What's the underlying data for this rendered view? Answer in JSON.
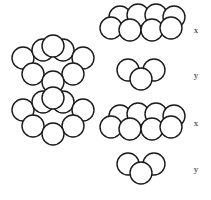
{
  "figure": {
    "stroke_color": "#1a1a1a",
    "fill_color": "#ffffff",
    "background_color": "#ffffff",
    "sphere_radius": 11,
    "label_font_size": 9
  },
  "stack": {
    "name": "assembled-stack",
    "description": "Four close-packed layers stacked in x-y-x-y sequence",
    "layers": [
      {
        "label": "x",
        "sphere_count": 5,
        "spheres": [
          {
            "cx": 23,
            "cy": 58
          },
          {
            "cx": 43,
            "cy": 50
          },
          {
            "cx": 63,
            "cy": 50
          },
          {
            "cx": 83,
            "cy": 58
          },
          {
            "cx": 53,
            "cy": 46
          }
        ]
      },
      {
        "label": "y",
        "sphere_count": 3,
        "spheres": [
          {
            "cx": 33,
            "cy": 74
          },
          {
            "cx": 73,
            "cy": 74
          },
          {
            "cx": 53,
            "cy": 82
          }
        ]
      },
      {
        "label": "x",
        "sphere_count": 5,
        "spheres": [
          {
            "cx": 23,
            "cy": 110
          },
          {
            "cx": 43,
            "cy": 102
          },
          {
            "cx": 63,
            "cy": 102
          },
          {
            "cx": 83,
            "cy": 110
          },
          {
            "cx": 53,
            "cy": 98
          }
        ]
      },
      {
        "label": "y",
        "sphere_count": 3,
        "spheres": [
          {
            "cx": 33,
            "cy": 126
          },
          {
            "cx": 73,
            "cy": 126
          },
          {
            "cx": 53,
            "cy": 134
          }
        ]
      }
    ]
  },
  "exploded_layers": [
    {
      "id": "layer-x-top",
      "label": "x",
      "label_x": 196,
      "label_y": 31,
      "sphere_count": 7,
      "back_row": [
        {
          "cx": 120,
          "cy": 17
        },
        {
          "cx": 138,
          "cy": 15
        },
        {
          "cx": 156,
          "cy": 15
        },
        {
          "cx": 174,
          "cy": 17
        }
      ],
      "front_row": [
        {
          "cx": 111,
          "cy": 28
        },
        {
          "cx": 130,
          "cy": 30
        },
        {
          "cx": 152,
          "cy": 30
        },
        {
          "cx": 171,
          "cy": 28
        }
      ]
    },
    {
      "id": "layer-y-upper",
      "label": "y",
      "label_x": 196,
      "label_y": 76,
      "sphere_count": 3,
      "back_row": [
        {
          "cx": 128,
          "cy": 70
        },
        {
          "cx": 154,
          "cy": 70
        }
      ],
      "front_row": [
        {
          "cx": 141,
          "cy": 79
        }
      ]
    },
    {
      "id": "layer-x-lower",
      "label": "x",
      "label_x": 196,
      "label_y": 124,
      "sphere_count": 7,
      "back_row": [
        {
          "cx": 120,
          "cy": 116
        },
        {
          "cx": 138,
          "cy": 114
        },
        {
          "cx": 156,
          "cy": 114
        },
        {
          "cx": 174,
          "cy": 116
        }
      ],
      "front_row": [
        {
          "cx": 111,
          "cy": 127
        },
        {
          "cx": 130,
          "cy": 129
        },
        {
          "cx": 152,
          "cy": 129
        },
        {
          "cx": 171,
          "cy": 127
        }
      ]
    },
    {
      "id": "layer-y-bottom",
      "label": "y",
      "label_x": 196,
      "label_y": 170,
      "sphere_count": 3,
      "back_row": [
        {
          "cx": 128,
          "cy": 164
        },
        {
          "cx": 154,
          "cy": 164
        }
      ],
      "front_row": [
        {
          "cx": 141,
          "cy": 173
        }
      ]
    }
  ]
}
